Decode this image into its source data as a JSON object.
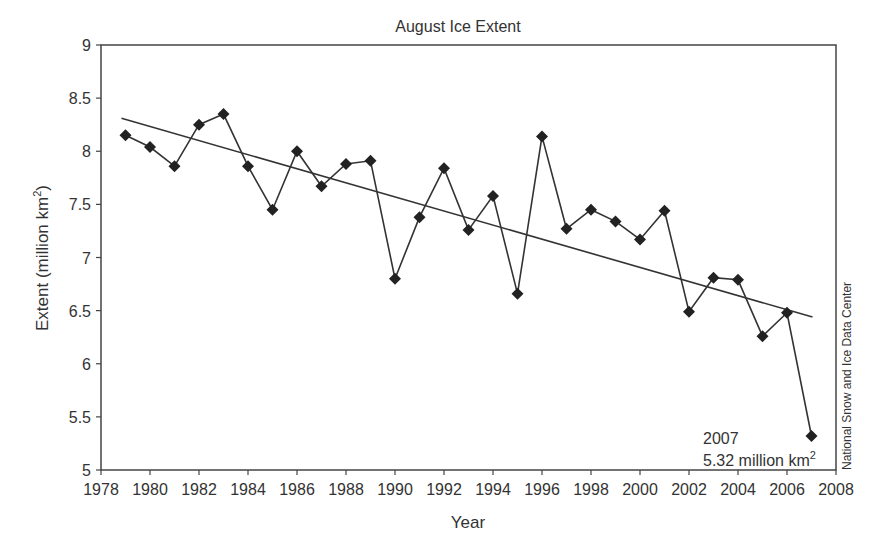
{
  "chart_data": {
    "type": "line",
    "title": "August Ice Extent",
    "xlabel": "Year",
    "ylabel": "Extent (million km²)",
    "ylabel_base": "Extent (million km",
    "ylabel_sup": "2",
    "ylabel_close": ")",
    "xlim": [
      1978,
      2008
    ],
    "ylim": [
      5,
      9
    ],
    "grid": false,
    "legend": null,
    "x_ticks": [
      "1978",
      "1980",
      "1982",
      "1984",
      "1986",
      "1988",
      "1990",
      "1992",
      "1994",
      "1996",
      "1998",
      "2000",
      "2002",
      "2004",
      "2006",
      "2008"
    ],
    "y_ticks": [
      "5",
      "5.5",
      "6",
      "6.5",
      "7",
      "7.5",
      "8",
      "8.5",
      "9"
    ],
    "x": [
      1979,
      1980,
      1981,
      1982,
      1983,
      1984,
      1985,
      1986,
      1987,
      1988,
      1989,
      1990,
      1991,
      1992,
      1993,
      1994,
      1995,
      1996,
      1997,
      1998,
      1999,
      2000,
      2001,
      2002,
      2003,
      2004,
      2005,
      2006,
      2007
    ],
    "series": [
      {
        "name": "August Ice Extent",
        "marker": "diamond",
        "values": [
          8.15,
          8.04,
          7.86,
          8.25,
          8.35,
          7.86,
          7.45,
          8.0,
          7.67,
          7.88,
          7.91,
          6.8,
          7.38,
          7.84,
          7.26,
          7.58,
          6.66,
          8.14,
          7.27,
          7.45,
          7.34,
          7.17,
          7.44,
          6.49,
          6.81,
          6.79,
          6.26,
          6.48,
          5.32
        ]
      },
      {
        "name": "Linear trend",
        "type": "line",
        "x": [
          1979,
          2007
        ],
        "values": [
          8.31,
          6.44
        ]
      }
    ],
    "annotation": {
      "line1": "2007",
      "line2_base": "5.32 million km",
      "line2_sup": "2"
    },
    "credit": "National Snow and Ice Data Center"
  }
}
